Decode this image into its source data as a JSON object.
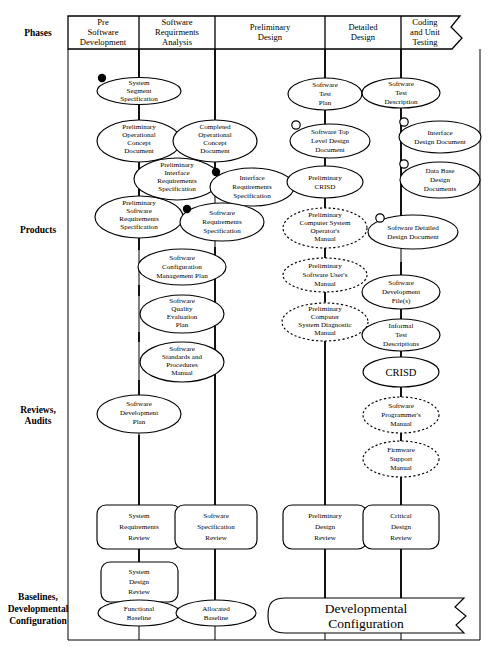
{
  "diagram": {
    "type": "flow-diagram"
  },
  "row_labels": [
    {
      "id": "phases",
      "label": "Phases",
      "label2": "",
      "label3": ""
    },
    {
      "id": "products",
      "label": "Products",
      "label2": "",
      "label3": ""
    },
    {
      "id": "reviews",
      "label": "Reviews,",
      "label2": "Audits",
      "label3": ""
    },
    {
      "id": "baselines",
      "label": "Baselines,",
      "label2": "Developmental",
      "label3": "Configuration"
    }
  ],
  "phases": [
    {
      "id": "pre-software-development",
      "l1": "Pre",
      "l2": "Software",
      "l3": "Development"
    },
    {
      "id": "software-requirements-analysis",
      "l1": "Software",
      "l2": "Requirments",
      "l3": "Analysis"
    },
    {
      "id": "preliminary-design",
      "l1": "Preliminary",
      "l2": "Design",
      "l3": ""
    },
    {
      "id": "detailed-design",
      "l1": "Detailed",
      "l2": "Design",
      "l3": ""
    },
    {
      "id": "coding-and-unit-testing",
      "l1": "Coding",
      "l2": "and Unit",
      "l3": "Testing"
    }
  ],
  "products": [
    {
      "id": "system-segment-specification",
      "lines": [
        "System",
        "Segment",
        "Specification"
      ],
      "style": "solid",
      "marker": "filled"
    },
    {
      "id": "preliminary-operational-concept-document",
      "lines": [
        "Preliminary",
        "Operational",
        "Concept",
        "Document"
      ],
      "style": "solid",
      "marker": "none"
    },
    {
      "id": "completed-operational-concept-document",
      "lines": [
        "Completed",
        "Operational",
        "Concept",
        "Document"
      ],
      "style": "solid",
      "marker": "none"
    },
    {
      "id": "preliminary-interface-requirements-specification",
      "lines": [
        "Preliminary",
        "Interface",
        "Requirements",
        "Specification"
      ],
      "style": "solid",
      "marker": "none"
    },
    {
      "id": "interface-requirements-specification",
      "lines": [
        "Interface",
        "Requirements",
        "Specification"
      ],
      "style": "solid",
      "marker": "filled"
    },
    {
      "id": "preliminary-software-requirements-specification",
      "lines": [
        "Preliminary",
        "Software",
        "Requirements",
        "Specification"
      ],
      "style": "solid",
      "marker": "none"
    },
    {
      "id": "software-requirements-specification",
      "lines": [
        "Software",
        "Requirements",
        "Specification"
      ],
      "style": "solid",
      "marker": "filled"
    },
    {
      "id": "software-configuration-management-plan",
      "lines": [
        "Software",
        "Configuration",
        "Management Plan"
      ],
      "style": "solid",
      "marker": "none"
    },
    {
      "id": "software-quality-evaluation-plan",
      "lines": [
        "Software",
        "Quality",
        "Evaluation",
        "Plan"
      ],
      "style": "solid",
      "marker": "none"
    },
    {
      "id": "software-standards-and-procedures-manual",
      "lines": [
        "Software",
        "Standards and",
        "Procedures",
        "Manual"
      ],
      "style": "solid",
      "marker": "none"
    },
    {
      "id": "software-development-plan",
      "lines": [
        "Software",
        "Development",
        "Plan"
      ],
      "style": "solid",
      "marker": "none"
    },
    {
      "id": "software-test-plan",
      "lines": [
        "Software",
        "Test",
        "Plan"
      ],
      "style": "solid",
      "marker": "none"
    },
    {
      "id": "software-top-level-design-document",
      "lines": [
        "Software Top",
        "Level Design",
        "Document"
      ],
      "style": "solid",
      "marker": "open"
    },
    {
      "id": "preliminary-crisd",
      "lines": [
        "Preliminary",
        "CRISD"
      ],
      "style": "solid",
      "marker": "none"
    },
    {
      "id": "preliminary-computer-system-operators-manual",
      "lines": [
        "Preliminary",
        "Computer System",
        "Operator's",
        "Manual"
      ],
      "style": "dashed",
      "marker": "none"
    },
    {
      "id": "preliminary-software-users-manual",
      "lines": [
        "Preliminary",
        "Software User's",
        "Manual"
      ],
      "style": "dashed",
      "marker": "none"
    },
    {
      "id": "preliminary-computer-system-diagnostic-manual",
      "lines": [
        "Preliminary",
        "Computer",
        "System Diagnostic",
        "Manual"
      ],
      "style": "dashed",
      "marker": "none"
    },
    {
      "id": "software-test-description",
      "lines": [
        "Software",
        "Test",
        "Description"
      ],
      "style": "solid",
      "marker": "none"
    },
    {
      "id": "interface-design-document",
      "lines": [
        "Interface",
        "Design Document"
      ],
      "style": "solid",
      "marker": "open"
    },
    {
      "id": "data-base-design-documents",
      "lines": [
        "Data Base",
        "Design",
        "Documents"
      ],
      "style": "solid",
      "marker": "open"
    },
    {
      "id": "software-detailed-design-document",
      "lines": [
        "Software Detailed",
        "Design Document"
      ],
      "style": "solid",
      "marker": "open"
    },
    {
      "id": "software-development-files",
      "lines": [
        "Software",
        "Development",
        "File(s)"
      ],
      "style": "solid",
      "marker": "none"
    },
    {
      "id": "informal-test-descriptions",
      "lines": [
        "Informal",
        "Test",
        "Descriptions"
      ],
      "style": "solid",
      "marker": "none"
    },
    {
      "id": "crisd",
      "lines": [
        "CRISD"
      ],
      "style": "solid",
      "marker": "none",
      "big": true
    },
    {
      "id": "software-programmers-manual",
      "lines": [
        "Software",
        "Programmer's",
        "Manual"
      ],
      "style": "dashed",
      "marker": "none"
    },
    {
      "id": "firmware-support-manual",
      "lines": [
        "Firmware",
        "Support",
        "Manual"
      ],
      "style": "dashed",
      "marker": "none"
    }
  ],
  "reviews": [
    {
      "id": "system-requirements-review",
      "lines": [
        "System",
        "Requirements",
        "Review"
      ]
    },
    {
      "id": "software-specification-review",
      "lines": [
        "Software",
        "Specification",
        "Review"
      ]
    },
    {
      "id": "system-design-review",
      "lines": [
        "System",
        "Design",
        "Review"
      ]
    },
    {
      "id": "preliminary-design-review",
      "lines": [
        "Preliminary",
        "Design",
        "Review"
      ]
    },
    {
      "id": "critical-design-review",
      "lines": [
        "Critical",
        "Design",
        "Review"
      ]
    }
  ],
  "baselines": [
    {
      "id": "functional-baseline",
      "lines": [
        "Functional",
        "Baseline"
      ]
    },
    {
      "id": "allocated-baseline",
      "lines": [
        "Allocated",
        "Baseline"
      ]
    },
    {
      "id": "developmental-configuration",
      "lines": [
        "Developmental",
        "Configuration"
      ]
    }
  ],
  "legend": {
    "filled_dot": "filled-baseline-marker",
    "open_circle": "open-baseline-marker"
  },
  "colors": {
    "ink": "#000000",
    "paper": "#ffffff"
  }
}
